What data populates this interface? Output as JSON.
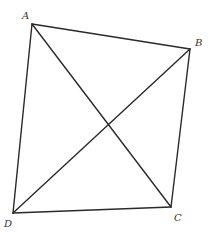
{
  "diagram": {
    "type": "quadrilateral-with-diagonals",
    "stroke_color": "#2a2a2a",
    "label_color": "#333333",
    "vertices": {
      "A": {
        "label": "A",
        "x": 32,
        "y": 24,
        "label_x": 22,
        "label_y": 19
      },
      "B": {
        "label": "B",
        "x": 190,
        "y": 49,
        "label_x": 195,
        "label_y": 46
      },
      "C": {
        "label": "C",
        "x": 171,
        "y": 207,
        "label_x": 174,
        "label_y": 221
      },
      "D": {
        "label": "D",
        "x": 13,
        "y": 213,
        "label_x": 4,
        "label_y": 227
      }
    },
    "edges": [
      {
        "from": "A",
        "to": "B",
        "kind": "side"
      },
      {
        "from": "B",
        "to": "C",
        "kind": "side"
      },
      {
        "from": "C",
        "to": "D",
        "kind": "side"
      },
      {
        "from": "D",
        "to": "A",
        "kind": "side"
      },
      {
        "from": "A",
        "to": "C",
        "kind": "diagonal"
      },
      {
        "from": "B",
        "to": "D",
        "kind": "diagonal"
      }
    ]
  }
}
